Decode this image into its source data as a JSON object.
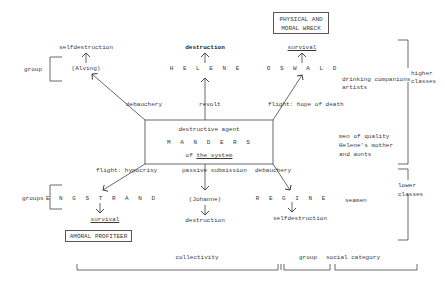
{
  "top": {
    "alving_outcome": "selfdestruction",
    "alving": "(Alving)",
    "helene_outcome": "destruction",
    "helene": "H E L E N E",
    "oswald_outcome": "survival",
    "oswald": "O S W A L D",
    "physical_moral_wreck_line1": "PHYSICAL AND",
    "physical_moral_wreck_line2": "MORAL WRECK"
  },
  "upper_edges": {
    "left": "debauchery",
    "center": "revolt",
    "right": "flight: hope of death"
  },
  "center_box": {
    "line1": "destructive agent",
    "line2": "M A N D E R S",
    "line3_prefix": "of ",
    "line3_underlined": "the system"
  },
  "lower_edges": {
    "left": "flight: hypocrisy",
    "center": "passive submission",
    "right": "debauchery"
  },
  "bottom": {
    "engstrand": "E N G S T R A N D",
    "engstrand_outcome": "survival",
    "amoral_profiteer": "AMORAL PROFITEER",
    "johanne": "(Johanne)",
    "johanne_outcome": "destruction",
    "regine": "R E G I N E",
    "regine_outcome": "selfdestruction"
  },
  "side_labels": {
    "group_upper": "group",
    "groups_lower": "groups",
    "drinking_companions_line1": "drinking companions",
    "drinking_companions_line2": "artists",
    "men_of_quality_line1": "men of quality",
    "men_of_quality_line2": "Helene's mother",
    "men_of_quality_line3": "and aunts",
    "seamen": "seamen",
    "higher_classes_line1": "higher",
    "higher_classes_line2": "classes",
    "lower_classes_line1": "lower",
    "lower_classes_line2": "classes"
  },
  "bottom_brackets": {
    "collectivity": "collectivity",
    "group": "group",
    "social_category": "social category"
  }
}
